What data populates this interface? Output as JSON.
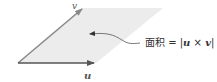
{
  "diagram": {
    "vector_u_label": "u",
    "vector_v_label": "v",
    "area_label_prefix": "面积 = |",
    "area_label_u": "u",
    "area_label_times": " × ",
    "area_label_v": "v",
    "area_label_suffix": "|",
    "colors": {
      "parallelogram_fill": "#ececec",
      "vector_u": "#555555",
      "vector_v": "#8a8a8a",
      "callout": "#555555"
    }
  }
}
